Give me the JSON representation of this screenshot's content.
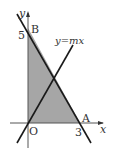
{
  "diagram": {
    "y_axis_label": "y",
    "x_axis_label": "x",
    "origin_label": "O",
    "point_B_label": "B",
    "point_A_label": "A",
    "y_intercept_value": "5",
    "x_intercept_value": "3",
    "line_label": "y=mx",
    "colors": {
      "shaded_region": "#a6a6a6",
      "lines": "#1a1a1a",
      "axes": "#555555"
    }
  }
}
